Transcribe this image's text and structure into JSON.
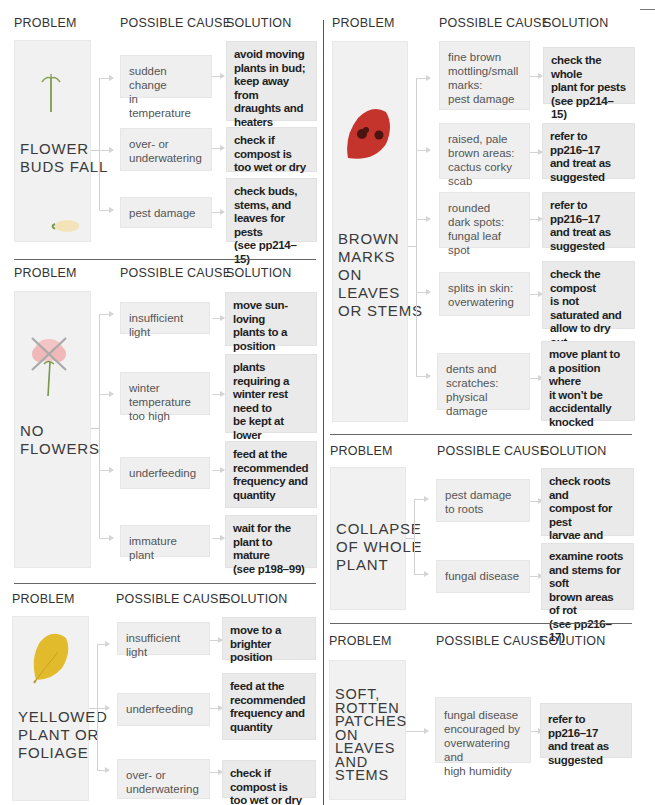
{
  "headers": {
    "problem": "PROBLEM",
    "cause": "POSSIBLE CAUSE",
    "solution": "SOLUTION"
  },
  "sections": [
    {
      "id": "flower-buds-fall",
      "problem": "FLOWER\nBUDS FALL",
      "illustration": "flower-bud-icon",
      "rows": [
        {
          "cause": "sudden change\nin temperature",
          "solution": "avoid moving\nplants in bud;\nkeep away from\ndraughts and\nheaters"
        },
        {
          "cause": "over- or\nunderwatering",
          "solution": "check if compost is\ntoo wet or dry"
        },
        {
          "cause": "pest damage",
          "solution": "check buds,\nstems, and\nleaves for pests\n(see pp214–15)"
        }
      ]
    },
    {
      "id": "no-flowers",
      "problem": "NO\nFLOWERS",
      "illustration": "crossed-flower-icon",
      "rows": [
        {
          "cause": "insufficient light",
          "solution": "move sun-loving\nplants to a position\nin bright light"
        },
        {
          "cause": "winter temperature\ntoo high",
          "solution": "plants requiring a\nwinter rest need to\nbe kept at lower\ntemperatures for\nthis period"
        },
        {
          "cause": "underfeeding",
          "solution": "feed at the\nrecommended\nfrequency and\nquantity"
        },
        {
          "cause": "immature plant",
          "solution": "wait for the\nplant to mature\n(see p198–99)"
        }
      ]
    },
    {
      "id": "yellowed-plant",
      "problem": "YELLOWED\nPLANT OR\nFOLIAGE",
      "illustration": "yellow-leaf-icon",
      "rows": [
        {
          "cause": "insufficient light",
          "solution": "move to a\nbrighter position"
        },
        {
          "cause": "underfeeding",
          "solution": "feed at the\nrecommended\nfrequency and\nquantity"
        },
        {
          "cause": "over- or\nunderwatering",
          "solution": "check if compost is\ntoo wet or dry"
        }
      ]
    },
    {
      "id": "brown-marks",
      "problem": "BROWN\nMARKS\nON\nLEAVES\nOR STEMS",
      "illustration": "spotted-leaf-icon",
      "rows": [
        {
          "cause": "fine brown\nmottling/small\nmarks:\npest damage",
          "solution": "check the whole\nplant for pests\n(see pp214–15)"
        },
        {
          "cause": "raised, pale\nbrown areas:\ncactus corky scab",
          "solution": "refer to pp216–17\nand treat as\nsuggested"
        },
        {
          "cause": "rounded\ndark spots:\nfungal leaf spot",
          "solution": "refer to pp216–17\nand treat as\nsuggested"
        },
        {
          "cause": "splits in skin:\noverwatering",
          "solution": "check the compost\nis not saturated and\nallow to dry out\nbetween waterings"
        },
        {
          "cause": "dents and\nscratches:\nphysical damage",
          "solution": "move plant to\na position where\nit won’t be\naccidentally\nknocked"
        }
      ]
    },
    {
      "id": "collapse",
      "problem": "COLLAPSE\nOF WHOLE\nPLANT",
      "rows": [
        {
          "cause": "pest damage\nto roots",
          "solution": "check roots and\ncompost for pest\nlarvae and eggs\n(see pp214–15)"
        },
        {
          "cause": "fungal disease",
          "solution": "examine roots\nand stems for soft\nbrown areas of rot\n(see pp216–17)"
        }
      ]
    },
    {
      "id": "soft-rotten",
      "problem": "SOFT,\nROTTEN\nPATCHES\nON\nLEAVES\nAND\nSTEMS",
      "rows": [
        {
          "cause": "fungal disease\nencouraged by\noverwatering and\nhigh humidity",
          "solution": "refer to pp216–17\nand treat as\nsuggested"
        }
      ]
    }
  ],
  "colors": {
    "problem_bg": "#f1f1f1",
    "cause_bg": "#efefef",
    "solution_bg": "#eaeaea",
    "leaf_red": "#c4342c",
    "leaf_yellow": "#e2bb2c",
    "spot_dark": "#4a1410",
    "bud_green": "#8aa35a",
    "flower_pink": "#f3b9b9"
  }
}
